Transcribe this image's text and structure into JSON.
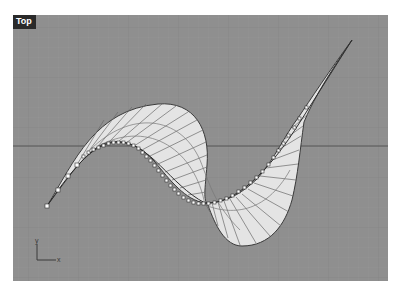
{
  "viewport": {
    "title": "Top",
    "background_color": "#8f8f8f",
    "grid_minor_color": "#939393",
    "grid_major_color": "#7d7d7d",
    "x_axis_color": "#5a5a5a",
    "surface_fill": "#e6e6e6",
    "curve_color": "#3c3c3c",
    "control_point_fill": "#ffffff"
  },
  "axis_indicator": {
    "x_label": "x",
    "y_label": "y"
  }
}
